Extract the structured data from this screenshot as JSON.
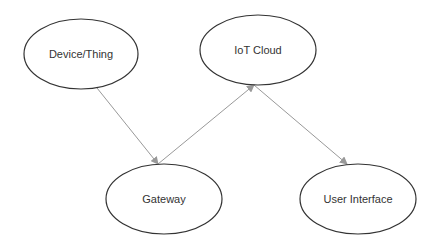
{
  "diagram": {
    "nodes": [
      {
        "id": "device",
        "label": "Device/Thing",
        "cx": 81,
        "cy": 54,
        "rx": 57,
        "ry": 35
      },
      {
        "id": "cloud",
        "label": "IoT Cloud",
        "cx": 258,
        "cy": 50,
        "rx": 58,
        "ry": 35
      },
      {
        "id": "gateway",
        "label": "Gateway",
        "cx": 164,
        "cy": 199,
        "rx": 58,
        "ry": 35
      },
      {
        "id": "ui",
        "label": "User Interface",
        "cx": 358,
        "cy": 199,
        "rx": 58,
        "ry": 35
      }
    ],
    "edges": [
      {
        "from": "device",
        "to": "gateway",
        "x1": 97,
        "y1": 88,
        "x2": 158,
        "y2": 164
      },
      {
        "from": "gateway",
        "to": "cloud",
        "x1": 158,
        "y1": 164,
        "x2": 254,
        "y2": 85
      },
      {
        "from": "cloud",
        "to": "ui",
        "x1": 254,
        "y1": 85,
        "x2": 347,
        "y2": 164
      }
    ],
    "colors": {
      "node_stroke": "#333333",
      "edge": "#999999",
      "text": "#333333",
      "background": "#ffffff"
    }
  }
}
